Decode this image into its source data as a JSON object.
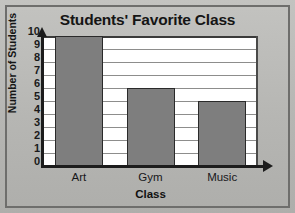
{
  "chart_data": {
    "type": "bar",
    "title": "Students' Favorite Class",
    "xlabel": "Class",
    "ylabel": "Number of Students",
    "categories": [
      "Art",
      "Gym",
      "Music"
    ],
    "values": [
      10,
      6,
      5
    ],
    "ylim": [
      0,
      10
    ],
    "ytick_labels": [
      "10",
      "9",
      "8",
      "7",
      "6",
      "5",
      "4",
      "3",
      "2",
      "1",
      "0"
    ],
    "ytick_values": [
      10,
      9,
      8,
      7,
      6,
      5,
      4,
      3,
      2,
      1,
      0
    ],
    "grid": true,
    "legend": "none",
    "bar_color": "#7e7e7e",
    "bar_edge_color": "#2a2a2a",
    "plot_background": "#ffffff",
    "page_background": "#b9b9b6",
    "axis_color": "#1c1c1c",
    "gridline_color": "#8d8d8c"
  }
}
